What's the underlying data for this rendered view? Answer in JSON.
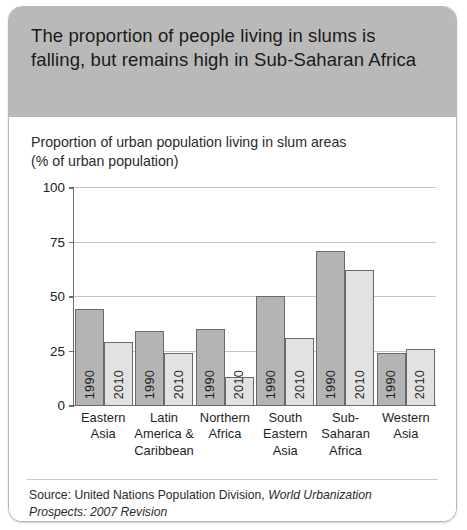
{
  "header": {
    "title": "The proportion of people living in slums is falling, but remains high in Sub-Saharan Africa"
  },
  "chart_data": {
    "type": "bar",
    "title": "Proportion of urban population living in slum areas (% of urban population)",
    "subtitle_line1": "Proportion of urban population living in slum areas",
    "subtitle_line2": "(% of urban population)",
    "xlabel": "",
    "ylabel": "% of urban population",
    "ylim": [
      0,
      100
    ],
    "yticks": [
      0,
      25,
      50,
      75,
      100
    ],
    "grid": true,
    "legend": "none",
    "categories": [
      "Eastern Asia",
      "Latin America & Caribbean",
      "Northern Africa",
      "South Eastern Asia",
      "Sub-Saharan Africa",
      "Western Asia"
    ],
    "category_lines": [
      [
        "Eastern",
        "Asia"
      ],
      [
        "Latin",
        "America &",
        "Caribbean"
      ],
      [
        "Northern",
        "Africa"
      ],
      [
        "South",
        "Eastern",
        "Asia"
      ],
      [
        "Sub-",
        "Saharan",
        "Africa"
      ],
      [
        "Western",
        "Asia"
      ]
    ],
    "series": [
      {
        "name": "1990",
        "color": "#b4b4b4",
        "values": [
          44,
          34,
          35,
          50,
          71,
          24
        ]
      },
      {
        "name": "2010",
        "color": "#e2e2e2",
        "values": [
          29,
          24,
          13,
          31,
          62,
          26
        ]
      }
    ]
  },
  "footer": {
    "source_prefix": "Source: United Nations Population Division, ",
    "source_italic_1": "World Urbanization",
    "source_italic_2": "Prospects: 2007 Revision"
  }
}
